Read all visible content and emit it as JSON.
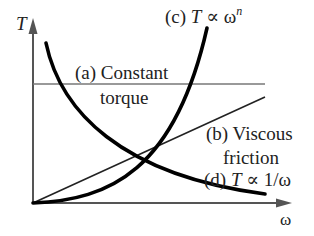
{
  "diagram": {
    "axes": {
      "y_label": "T",
      "x_label": "ω"
    },
    "curves": [
      {
        "id": "a",
        "label_line1": "(a) Constant",
        "label_line2": "torque",
        "shape": "horizontal line"
      },
      {
        "id": "b",
        "label_line1": "(b) Viscous",
        "label_line2": "friction",
        "shape": "straight line through origin"
      },
      {
        "id": "c",
        "label_prefix": "(c) ",
        "label_T": "T",
        "label_rel": " ∝ ω",
        "label_sup": "n",
        "shape": "rising power curve"
      },
      {
        "id": "d",
        "label_prefix": "(d) ",
        "label_T": "T",
        "label_rel": " ∝ 1/ω",
        "shape": "falling hyperbola"
      }
    ],
    "colors": {
      "curve": "#000000",
      "thin_line": "#333333",
      "axis": "#555555",
      "constant_line": "#777777",
      "text": "#222222"
    }
  }
}
